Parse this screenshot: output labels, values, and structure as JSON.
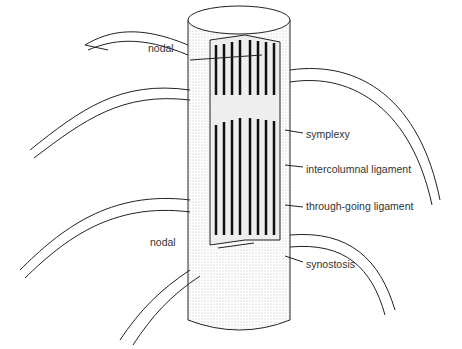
{
  "diagram": {
    "labels": {
      "nodal_top": "nodal",
      "symplexy": "symplexy",
      "intercolumnal_ligament": "intercolumnal ligament",
      "through_going_ligament": "through-going ligament",
      "nodal_bottom": "nodal",
      "synostosis": "synostosis"
    },
    "colors": {
      "line": "#222222",
      "stipple": "#cfcfcf",
      "ligament": "#111111",
      "text": "#333333"
    }
  }
}
